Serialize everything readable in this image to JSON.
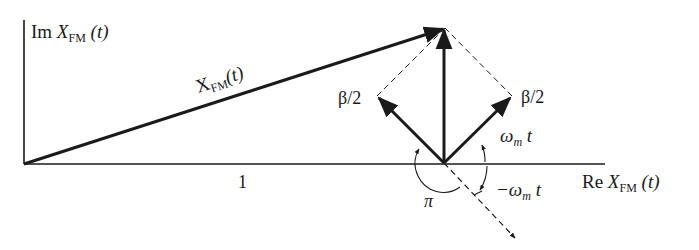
{
  "diagram": {
    "type": "phasor-diagram",
    "axes": {
      "vertical_label": {
        "main": "Im ",
        "var": "X",
        "sub": "FM",
        "arg": " (t)"
      },
      "horizontal_label": {
        "main": "Re ",
        "var": "X",
        "sub": "FM",
        "arg": " (t)"
      }
    },
    "main_phasor_label": {
      "var": "X",
      "sub": "FM",
      "arg": "(t)"
    },
    "unit_label": "1",
    "sideband_left_label": "β/2",
    "sideband_right_label": "β/2",
    "angle_pos_label": {
      "var": "ω",
      "sub": "m",
      "arg": " t"
    },
    "angle_neg_label": {
      "var": "−ω",
      "sub": "m",
      "arg": " t"
    },
    "angle_pi_label": "π",
    "colors": {
      "ink": "#1a1a1a",
      "background": "#ffffff"
    }
  }
}
